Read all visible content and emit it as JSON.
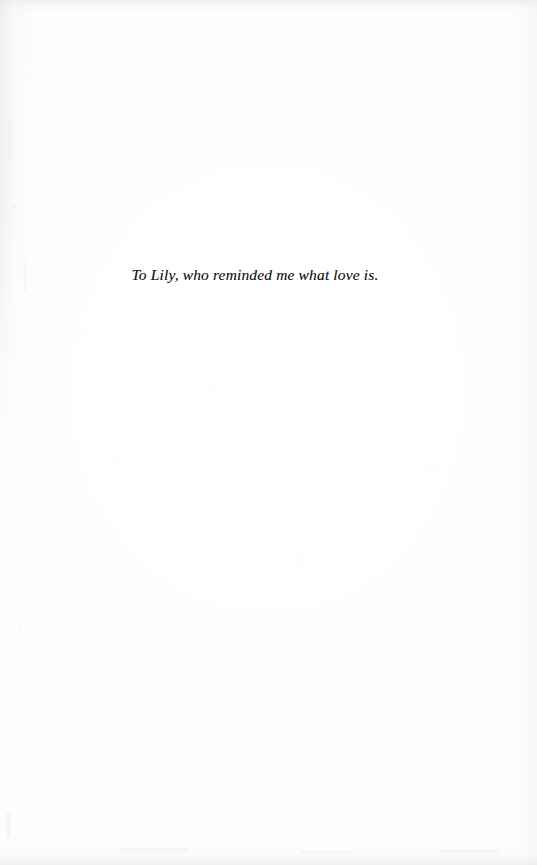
{
  "page": {
    "kind": "book-dedication-page",
    "width": 537,
    "height": 865,
    "background_color": "#fefefe",
    "ink_color": "#16161a"
  },
  "dedication": {
    "text": "To Lily, who reminded me what love is.",
    "style": "italic-serif",
    "alignment": "center"
  },
  "artifacts": {
    "top_edge_label": "scan-edge-shading-top",
    "bottom_edge_label": "scan-edge-shading-bottom",
    "gutter_label": "binding-gutter-shadow",
    "right_edge_label": "page-edge-falloff",
    "speckle_label": "scan-speckle-noise"
  }
}
